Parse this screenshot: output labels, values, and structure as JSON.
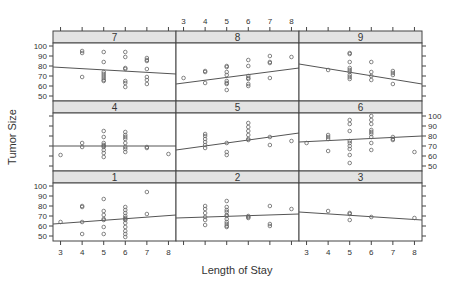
{
  "chart_data": {
    "type": "scatter",
    "layout": "trellis 3x3 panels with per-panel regression line",
    "xlabel": "Length of Stay",
    "ylabel": "Tumor Size",
    "xlim": [
      2.65,
      8.35
    ],
    "ylim": [
      45,
      103
    ],
    "x_ticks": [
      3,
      4,
      5,
      6,
      7,
      8
    ],
    "y_ticks": [
      50,
      60,
      70,
      80,
      90,
      100
    ],
    "grid": false,
    "panel_order_rows_top_to_bottom": [
      [
        "7",
        "8",
        "9"
      ],
      [
        "4",
        "5",
        "6"
      ],
      [
        "1",
        "2",
        "3"
      ]
    ],
    "panels": [
      {
        "label": "1",
        "points": [
          [
            3,
            64
          ],
          [
            4,
            80
          ],
          [
            4,
            79
          ],
          [
            4,
            64
          ],
          [
            4,
            52
          ],
          [
            5,
            87
          ],
          [
            5,
            75
          ],
          [
            5,
            71
          ],
          [
            5,
            67
          ],
          [
            5,
            66
          ],
          [
            5,
            59
          ],
          [
            5,
            52
          ],
          [
            6,
            79
          ],
          [
            6,
            76
          ],
          [
            6,
            73
          ],
          [
            6,
            70
          ],
          [
            6,
            68
          ],
          [
            6,
            67
          ],
          [
            6,
            66
          ],
          [
            6,
            63
          ],
          [
            6,
            59
          ],
          [
            6,
            55
          ],
          [
            6,
            52
          ],
          [
            6,
            49
          ],
          [
            7,
            94
          ],
          [
            7,
            72
          ]
        ],
        "line": [
          [
            2.65,
            62
          ],
          [
            8.35,
            71
          ]
        ]
      },
      {
        "label": "2",
        "points": [
          [
            4,
            80
          ],
          [
            4,
            77
          ],
          [
            4,
            73
          ],
          [
            4,
            69
          ],
          [
            4,
            66
          ],
          [
            4,
            61
          ],
          [
            5,
            85
          ],
          [
            5,
            79
          ],
          [
            5,
            76
          ],
          [
            5,
            74
          ],
          [
            5,
            71
          ],
          [
            5,
            70
          ],
          [
            5,
            67
          ],
          [
            5,
            64
          ],
          [
            5,
            62
          ],
          [
            5,
            60
          ],
          [
            5,
            59
          ],
          [
            6,
            70
          ],
          [
            6,
            69
          ],
          [
            6,
            68
          ],
          [
            7,
            80
          ],
          [
            7,
            62
          ],
          [
            7,
            60
          ],
          [
            8,
            77
          ]
        ],
        "line": [
          [
            2.65,
            68
          ],
          [
            8.35,
            72
          ]
        ]
      },
      {
        "label": "3",
        "points": [
          [
            4,
            75
          ],
          [
            5,
            73
          ],
          [
            5,
            72
          ],
          [
            5,
            66
          ],
          [
            6,
            69
          ],
          [
            8,
            68
          ]
        ],
        "line": [
          [
            2.65,
            74
          ],
          [
            8.35,
            66
          ]
        ]
      },
      {
        "label": "4",
        "points": [
          [
            3,
            61
          ],
          [
            4,
            73
          ],
          [
            4,
            69
          ],
          [
            5,
            85
          ],
          [
            5,
            79
          ],
          [
            5,
            73
          ],
          [
            5,
            71
          ],
          [
            5,
            70
          ],
          [
            5,
            69
          ],
          [
            5,
            66
          ],
          [
            5,
            63
          ],
          [
            5,
            59
          ],
          [
            6,
            84
          ],
          [
            6,
            81
          ],
          [
            6,
            79
          ],
          [
            6,
            77
          ],
          [
            6,
            73
          ],
          [
            6,
            69
          ],
          [
            6,
            67
          ],
          [
            6,
            64
          ],
          [
            7,
            69
          ],
          [
            7,
            68
          ],
          [
            8,
            62
          ]
        ],
        "line": [
          [
            2.65,
            70
          ],
          [
            8.35,
            70
          ]
        ]
      },
      {
        "label": "5",
        "points": [
          [
            4,
            82
          ],
          [
            4,
            80
          ],
          [
            4,
            77
          ],
          [
            4,
            74
          ],
          [
            4,
            71
          ],
          [
            4,
            68
          ],
          [
            5,
            73
          ],
          [
            5,
            64
          ],
          [
            5,
            61
          ],
          [
            6,
            93
          ],
          [
            6,
            89
          ],
          [
            6,
            85
          ],
          [
            6,
            81
          ],
          [
            6,
            77
          ],
          [
            6,
            76
          ],
          [
            7,
            79
          ],
          [
            7,
            71
          ],
          [
            8,
            75
          ]
        ],
        "line": [
          [
            2.65,
            66
          ],
          [
            8.35,
            83
          ]
        ]
      },
      {
        "label": "6",
        "points": [
          [
            3,
            73
          ],
          [
            4,
            81
          ],
          [
            4,
            79
          ],
          [
            4,
            77
          ],
          [
            4,
            65
          ],
          [
            5,
            96
          ],
          [
            5,
            92
          ],
          [
            5,
            85
          ],
          [
            5,
            75
          ],
          [
            5,
            73
          ],
          [
            5,
            70
          ],
          [
            5,
            67
          ],
          [
            5,
            61
          ],
          [
            5,
            53
          ],
          [
            6,
            100
          ],
          [
            6,
            96
          ],
          [
            6,
            92
          ],
          [
            6,
            86
          ],
          [
            6,
            84
          ],
          [
            6,
            82
          ],
          [
            6,
            79
          ],
          [
            6,
            73
          ],
          [
            6,
            66
          ],
          [
            7,
            79
          ],
          [
            7,
            77
          ],
          [
            7,
            76
          ],
          [
            8,
            64
          ]
        ],
        "line": [
          [
            2.65,
            74
          ],
          [
            8.35,
            80
          ]
        ]
      },
      {
        "label": "7",
        "points": [
          [
            4,
            95
          ],
          [
            4,
            93
          ],
          [
            4,
            69
          ],
          [
            5,
            94
          ],
          [
            5,
            84
          ],
          [
            5,
            74
          ],
          [
            5,
            72
          ],
          [
            5,
            70
          ],
          [
            5,
            68
          ],
          [
            5,
            66
          ],
          [
            5,
            65
          ],
          [
            6,
            94
          ],
          [
            6,
            89
          ],
          [
            6,
            78
          ],
          [
            6,
            77
          ],
          [
            6,
            65
          ],
          [
            6,
            63
          ],
          [
            6,
            59
          ],
          [
            7,
            88
          ],
          [
            7,
            86
          ],
          [
            7,
            85
          ],
          [
            7,
            77
          ],
          [
            7,
            69
          ],
          [
            7,
            66
          ],
          [
            7,
            62
          ]
        ],
        "line": [
          [
            2.65,
            79
          ],
          [
            8.35,
            72
          ]
        ]
      },
      {
        "label": "8",
        "points": [
          [
            3,
            68
          ],
          [
            4,
            75
          ],
          [
            4,
            74
          ],
          [
            4,
            63
          ],
          [
            5,
            80
          ],
          [
            5,
            79
          ],
          [
            5,
            74
          ],
          [
            5,
            71
          ],
          [
            5,
            65
          ],
          [
            5,
            63
          ],
          [
            5,
            62
          ],
          [
            5,
            56
          ],
          [
            6,
            86
          ],
          [
            6,
            80
          ],
          [
            6,
            70
          ],
          [
            6,
            68
          ],
          [
            6,
            67
          ],
          [
            6,
            62
          ],
          [
            6,
            60
          ],
          [
            7,
            90
          ],
          [
            7,
            84
          ],
          [
            7,
            83
          ],
          [
            7,
            68
          ],
          [
            8,
            89
          ]
        ],
        "line": [
          [
            2.65,
            62
          ],
          [
            8.35,
            78
          ]
        ]
      },
      {
        "label": "9",
        "points": [
          [
            4,
            76
          ],
          [
            5,
            93
          ],
          [
            5,
            92
          ],
          [
            5,
            84
          ],
          [
            5,
            78
          ],
          [
            5,
            76
          ],
          [
            5,
            74
          ],
          [
            5,
            71
          ],
          [
            5,
            69
          ],
          [
            5,
            67
          ],
          [
            6,
            84
          ],
          [
            6,
            74
          ],
          [
            6,
            70
          ],
          [
            6,
            66
          ],
          [
            7,
            75
          ],
          [
            7,
            73
          ],
          [
            7,
            71
          ],
          [
            7,
            62
          ]
        ],
        "line": [
          [
            2.65,
            82
          ],
          [
            8.35,
            62
          ]
        ]
      }
    ]
  },
  "axes": {
    "xlabel": "Length of Stay",
    "ylabel": "Tumor Size",
    "x_tick_labels": [
      "3",
      "4",
      "5",
      "6",
      "7",
      "8"
    ],
    "y_tick_labels": [
      "100",
      "90",
      "80",
      "70",
      "60",
      "50"
    ]
  },
  "colors": {
    "strip_bg": "#e3e3e3",
    "frame": "#444444",
    "points": "#666666",
    "line": "#555555",
    "text": "#333333"
  }
}
